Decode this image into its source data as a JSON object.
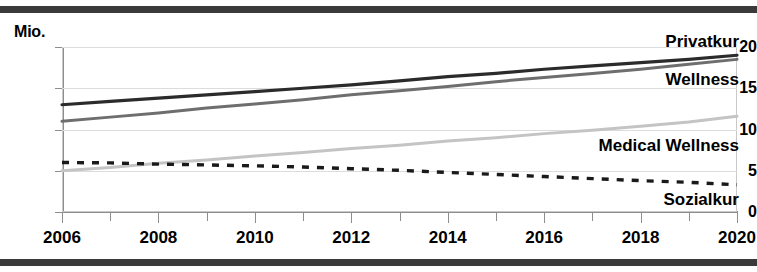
{
  "figure": {
    "unit_label": "Mio.",
    "top_rule_color": "#3a3a3a",
    "bottom_rule_color": "#3a3a3a",
    "background": "#ffffff"
  },
  "chart_data": {
    "type": "line",
    "title": "",
    "subtitle": "",
    "xlabel": "",
    "ylabel": "Mio.",
    "unit": "Mio.",
    "grid": true,
    "legend_position": "inline-right-annotations",
    "xlim": [
      2006,
      2020
    ],
    "ylim": [
      0,
      20
    ],
    "yticks": [
      0,
      5,
      10,
      15,
      20
    ],
    "ytick_labels": [
      "0",
      "5",
      "10",
      "15",
      "20"
    ],
    "xticks": [
      2006,
      2007,
      2008,
      2009,
      2010,
      2011,
      2012,
      2013,
      2014,
      2015,
      2016,
      2017,
      2018,
      2019,
      2020
    ],
    "xtick_labels_major": [
      "2006",
      "2008",
      "2010",
      "2012",
      "2014",
      "2016",
      "2018",
      "2020"
    ],
    "x": [
      2006,
      2007,
      2008,
      2009,
      2010,
      2011,
      2012,
      2013,
      2014,
      2015,
      2016,
      2017,
      2018,
      2019,
      2020
    ],
    "series": [
      {
        "name": "Privatkur",
        "color": "#2b2b2b",
        "style": "solid",
        "width": 3.2,
        "label_x": 2020,
        "label_y": 20.6,
        "values": [
          13.0,
          13.4,
          13.8,
          14.2,
          14.6,
          15.0,
          15.4,
          15.9,
          16.4,
          16.8,
          17.3,
          17.7,
          18.1,
          18.5,
          19.0
        ]
      },
      {
        "name": "Wellness",
        "color": "#6e6e6e",
        "style": "solid",
        "width": 3.0,
        "label_x": 2020,
        "label_y": 16.0,
        "values": [
          11.0,
          11.5,
          12.0,
          12.6,
          13.1,
          13.6,
          14.2,
          14.7,
          15.2,
          15.8,
          16.3,
          16.8,
          17.3,
          17.9,
          18.5
        ]
      },
      {
        "name": "Medical Wellness",
        "color": "#c4c4c4",
        "style": "solid",
        "width": 3.0,
        "label_x": 2020,
        "label_y": 8.0,
        "values": [
          5.0,
          5.4,
          5.9,
          6.3,
          6.8,
          7.2,
          7.7,
          8.1,
          8.6,
          9.0,
          9.5,
          9.9,
          10.4,
          10.9,
          11.6
        ]
      },
      {
        "name": "Sozialkur",
        "color": "#1a1a1a",
        "style": "dotted",
        "width": 3.4,
        "label_x": 2020,
        "label_y": 1.5,
        "values": [
          6.0,
          5.95,
          5.8,
          5.7,
          5.6,
          5.45,
          5.25,
          5.05,
          4.8,
          4.55,
          4.3,
          4.05,
          3.8,
          3.6,
          3.3
        ]
      }
    ]
  }
}
